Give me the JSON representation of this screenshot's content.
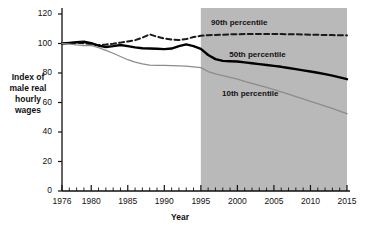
{
  "chart_data": {
    "type": "line",
    "title": "",
    "xlabel": "Year",
    "ylabel": "Index of male real hourly wages",
    "ylabel_lines": [
      "Index of",
      "male real",
      "hourly",
      "wages"
    ],
    "xlim": [
      1976,
      2015
    ],
    "ylim": [
      0,
      120
    ],
    "yticks": [
      0,
      20,
      40,
      60,
      80,
      100,
      120
    ],
    "xticks_major": [
      1976,
      1980,
      1985,
      1990,
      1995,
      2000,
      2005,
      2010,
      2015
    ],
    "xtick_minor_step": 1,
    "grid": false,
    "legend_position": "inline-labels",
    "shaded_region": {
      "label": "projection",
      "x_start": 1995,
      "x_end": 2015,
      "color": "#b9b9b9"
    },
    "series": [
      {
        "name": "90th percentile",
        "style": "dashed",
        "color": "#1a1a1a",
        "x": [
          1976,
          1977,
          1978,
          1979,
          1980,
          1981,
          1982,
          1983,
          1984,
          1985,
          1986,
          1987,
          1988,
          1989,
          1990,
          1991,
          1992,
          1993,
          1994,
          1995,
          1996,
          1997,
          1998,
          1999,
          2000,
          2001,
          2002,
          2003,
          2004,
          2005,
          2006,
          2007,
          2008,
          2009,
          2010,
          2011,
          2012,
          2013,
          2014,
          2015
        ],
        "y": [
          100.0,
          100.3,
          100.6,
          100.2,
          99.4,
          99.0,
          99.3,
          99.8,
          100.6,
          101.4,
          102.2,
          104.0,
          106.2,
          104.6,
          103.4,
          102.6,
          102.3,
          103.0,
          104.4,
          105.2,
          105.6,
          105.8,
          106.0,
          106.2,
          106.3,
          106.4,
          106.4,
          106.5,
          106.5,
          106.5,
          106.4,
          106.3,
          106.2,
          106.1,
          106.0,
          105.9,
          105.8,
          105.7,
          105.6,
          105.5
        ]
      },
      {
        "name": "50th percentile",
        "style": "solid-thick",
        "color": "#000000",
        "x": [
          1976,
          1977,
          1978,
          1979,
          1980,
          1981,
          1982,
          1983,
          1984,
          1985,
          1986,
          1987,
          1988,
          1989,
          1990,
          1991,
          1992,
          1993,
          1994,
          1995,
          1996,
          1997,
          1998,
          1999,
          2000,
          2001,
          2002,
          2003,
          2004,
          2005,
          2006,
          2007,
          2008,
          2009,
          2010,
          2011,
          2012,
          2013,
          2014,
          2015
        ],
        "y": [
          100.0,
          100.4,
          100.8,
          101.2,
          100.2,
          98.6,
          97.6,
          98.2,
          99.0,
          98.2,
          97.4,
          96.8,
          96.6,
          96.4,
          96.2,
          96.6,
          98.2,
          99.4,
          98.2,
          96.4,
          92.2,
          89.4,
          88.2,
          88.0,
          87.8,
          87.2,
          86.6,
          86.0,
          85.4,
          84.8,
          84.2,
          83.4,
          82.6,
          81.8,
          81.0,
          80.2,
          79.2,
          78.2,
          77.0,
          75.8
        ]
      },
      {
        "name": "10th percentile",
        "style": "solid-thin",
        "color": "#8c8c8c",
        "x": [
          1976,
          1977,
          1978,
          1979,
          1980,
          1981,
          1982,
          1983,
          1984,
          1985,
          1986,
          1987,
          1988,
          1989,
          1990,
          1991,
          1992,
          1993,
          1994,
          1995,
          1996,
          1997,
          1998,
          1999,
          2000,
          2001,
          2002,
          2003,
          2004,
          2005,
          2006,
          2007,
          2008,
          2009,
          2010,
          2011,
          2012,
          2013,
          2014,
          2015
        ],
        "y": [
          100.0,
          99.6,
          99.0,
          98.6,
          98.8,
          97.2,
          95.4,
          93.4,
          91.2,
          89.0,
          87.4,
          86.2,
          85.4,
          85.2,
          85.2,
          85.0,
          84.8,
          84.6,
          84.2,
          83.6,
          81.0,
          79.4,
          78.2,
          77.0,
          75.8,
          74.4,
          73.0,
          71.6,
          70.2,
          68.8,
          67.2,
          65.6,
          64.0,
          62.4,
          60.8,
          59.2,
          57.6,
          56.0,
          54.2,
          52.4
        ]
      }
    ],
    "annotations": [
      {
        "text": "90th percentile",
        "x": 2000.5,
        "y": 114.0
      },
      {
        "text": "50th percentile",
        "x": 2003.0,
        "y": 92.5
      },
      {
        "text": "10th percentile",
        "x": 2002.0,
        "y": 66.0
      }
    ]
  }
}
